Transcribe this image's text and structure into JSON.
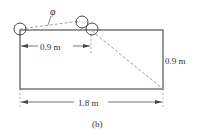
{
  "diagram": {
    "caption": "(b)",
    "angle_label": "φ",
    "top_dimension": "0.9 m",
    "right_dimension": "0.9 m",
    "bottom_dimension": "1.8 m",
    "colors": {
      "line": "#555555",
      "dashed": "#888888",
      "text": "#333333"
    }
  }
}
